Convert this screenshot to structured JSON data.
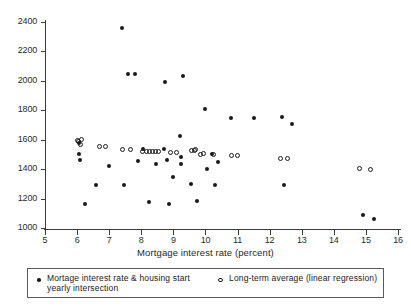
{
  "chart_data": {
    "type": "scatter",
    "title": "",
    "xlabel": "Mortgage interest rate (percent)",
    "ylabel": "",
    "xlim": [
      5,
      16
    ],
    "ylim": [
      1000,
      2400
    ],
    "xticks": [
      5,
      6,
      7,
      8,
      9,
      10,
      11,
      12,
      13,
      14,
      15,
      16
    ],
    "yticks": [
      1000,
      1200,
      1400,
      1600,
      1800,
      2000,
      2200,
      2400
    ],
    "grid": false,
    "legend_position": "bottom",
    "series": [
      {
        "name": "Mortage interest rate & housing start yearly intersection",
        "marker": "filled-circle",
        "color": "#1a1a1a",
        "points": [
          [
            6.05,
            1580
          ],
          [
            6.05,
            1500
          ],
          [
            6.1,
            1460
          ],
          [
            6.25,
            1160
          ],
          [
            6.6,
            1290
          ],
          [
            7.0,
            1420
          ],
          [
            7.4,
            2360
          ],
          [
            7.45,
            1290
          ],
          [
            7.6,
            2050
          ],
          [
            7.8,
            2050
          ],
          [
            7.9,
            1455
          ],
          [
            8.05,
            1540
          ],
          [
            8.25,
            1180
          ],
          [
            8.45,
            1435
          ],
          [
            8.7,
            1540
          ],
          [
            8.75,
            1990
          ],
          [
            8.8,
            1460
          ],
          [
            8.85,
            1160
          ],
          [
            9.0,
            1350
          ],
          [
            9.2,
            1625
          ],
          [
            9.25,
            1480
          ],
          [
            9.25,
            1435
          ],
          [
            9.3,
            2030
          ],
          [
            9.55,
            1300
          ],
          [
            9.75,
            1185
          ],
          [
            10.0,
            1810
          ],
          [
            10.05,
            1400
          ],
          [
            10.2,
            1505
          ],
          [
            10.3,
            1290
          ],
          [
            10.4,
            1450
          ],
          [
            10.8,
            1750
          ],
          [
            11.5,
            1745
          ],
          [
            12.4,
            1755
          ],
          [
            12.45,
            1290
          ],
          [
            12.7,
            1705
          ],
          [
            14.9,
            1085
          ],
          [
            15.25,
            1060
          ]
        ]
      },
      {
        "name": "Long-term average (linear regression)",
        "marker": "open-circle",
        "color": "#1a1a1a",
        "points": [
          [
            6.0,
            1595
          ],
          [
            6.05,
            1585
          ],
          [
            6.1,
            1570
          ],
          [
            6.15,
            1600
          ],
          [
            6.7,
            1555
          ],
          [
            6.9,
            1555
          ],
          [
            7.4,
            1535
          ],
          [
            7.65,
            1535
          ],
          [
            8.05,
            1520
          ],
          [
            8.15,
            1520
          ],
          [
            8.25,
            1520
          ],
          [
            8.35,
            1520
          ],
          [
            8.45,
            1520
          ],
          [
            8.55,
            1520
          ],
          [
            8.9,
            1515
          ],
          [
            9.1,
            1515
          ],
          [
            9.55,
            1530
          ],
          [
            9.65,
            1525
          ],
          [
            9.7,
            1535
          ],
          [
            9.85,
            1500
          ],
          [
            9.95,
            1505
          ],
          [
            10.25,
            1500
          ],
          [
            10.8,
            1495
          ],
          [
            11.0,
            1495
          ],
          [
            12.35,
            1470
          ],
          [
            12.55,
            1470
          ],
          [
            14.8,
            1405
          ],
          [
            15.15,
            1400
          ]
        ]
      }
    ]
  },
  "axis": {
    "x_title": "Mortgage interest rate (percent)",
    "x_tick_labels": [
      "5",
      "6",
      "7",
      "8",
      "9",
      "10",
      "11",
      "12",
      "13",
      "14",
      "15",
      "16"
    ],
    "y_tick_labels": [
      "2400",
      "2200",
      "2000",
      "1800",
      "1600",
      "1400",
      "1200",
      "1000"
    ]
  },
  "legend": {
    "entry1_line1": "Mortage interest rate & housing start",
    "entry1_line2": "yearly  intersection",
    "entry2": "Long-term average (linear regression)",
    "marker1": "filled-circle-marker",
    "marker2": "open-circle-marker"
  },
  "colors": {
    "marker": "#1a1a1a",
    "axis": "#3d3d3d",
    "background": "#ffffff",
    "legend_border": "#5a5a5a"
  }
}
